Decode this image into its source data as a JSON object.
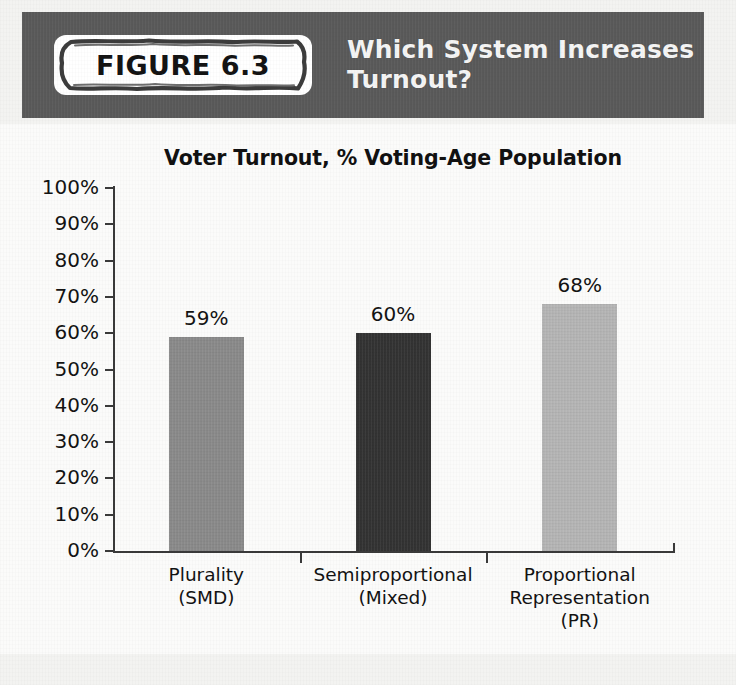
{
  "figure": {
    "badge_label": "FIGURE 6.3",
    "header_title_line1": "Which System Increases",
    "header_title_line2": "Turnout?",
    "header_bg": "#595959",
    "badge_bg": "#ffffff",
    "page_bg": "#f3f3f1",
    "panel_bg": "#fbfbfa"
  },
  "chart_data": {
    "type": "bar",
    "title": "Voter Turnout, % Voting-Age Population",
    "xlabel": "",
    "ylabel": "",
    "ylim": [
      0,
      100
    ],
    "grid": false,
    "legend": "none",
    "categories": [
      "Plurality\n(SMD)",
      "Semiproportional\n(Mixed)",
      "Proportional\nRepresentation\n(PR)"
    ],
    "category_lines": [
      [
        "Plurality",
        "(SMD)"
      ],
      [
        "Semiproportional",
        "(Mixed)"
      ],
      [
        "Proportional",
        "Representation",
        "(PR)"
      ]
    ],
    "values": [
      59,
      60,
      68
    ],
    "value_labels": [
      "59%",
      "60%",
      "68%"
    ],
    "bar_colors": [
      "#8a8a8a",
      "#333333",
      "#b5b5b5"
    ],
    "ytick_values": [
      100,
      90,
      80,
      70,
      60,
      50,
      40,
      30,
      20,
      10,
      0
    ],
    "ytick_labels": [
      "100%",
      "90%",
      "80%",
      "70%",
      "60%",
      "50%",
      "40%",
      "30%",
      "20%",
      "10%",
      "0%"
    ]
  }
}
